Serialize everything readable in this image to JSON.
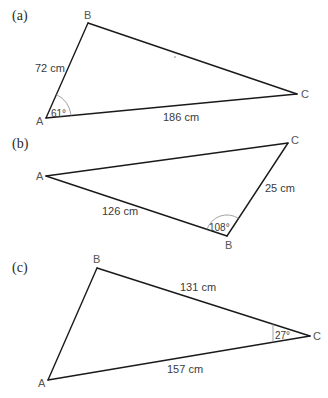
{
  "figure": {
    "triangles": [
      {
        "part_label": "(a)",
        "vertices": {
          "A": "A",
          "B": "B",
          "C": "C"
        },
        "sides": {
          "AB": "72 cm",
          "AC": "186 cm"
        },
        "angle": {
          "at": "A",
          "label": "61°"
        }
      },
      {
        "part_label": "(b)",
        "vertices": {
          "A": "A",
          "B": "B",
          "C": "C"
        },
        "sides": {
          "AB": "126 cm",
          "BC": "25 cm"
        },
        "angle": {
          "at": "B",
          "label": "108°"
        }
      },
      {
        "part_label": "(c)",
        "vertices": {
          "A": "A",
          "B": "B",
          "C": "C"
        },
        "sides": {
          "BC": "131 cm",
          "AC": "157 cm"
        },
        "angle": {
          "at": "C",
          "label": "27°"
        }
      }
    ]
  }
}
